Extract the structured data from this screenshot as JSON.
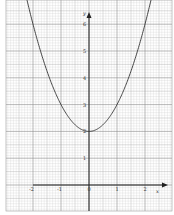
{
  "chart_data": {
    "type": "line",
    "title": "",
    "xlabel": "x",
    "ylabel": "y",
    "xlim": [
      -2.3,
      2.3
    ],
    "ylim": [
      0,
      7
    ],
    "grid": true,
    "grid_style": "graph paper (major 1 unit, minor 0.1 unit)",
    "legend": null,
    "x_ticks": [
      "-2",
      "-1",
      "0",
      "1",
      "2"
    ],
    "y_ticks": [
      "1",
      "2",
      "3",
      "4",
      "5",
      "6"
    ],
    "series": [
      {
        "name": "y = x^2 + 2",
        "x": [
          -2.3,
          -2,
          -1.5,
          -1,
          -0.5,
          0,
          0.5,
          1,
          1.5,
          2,
          2.3
        ],
        "values": [
          7.29,
          6,
          4.25,
          3,
          2.25,
          2,
          2.25,
          3,
          4.25,
          6,
          7.29
        ]
      }
    ]
  },
  "colors": {
    "paper": "#ffffff",
    "grid_minor": "#c8c8c8",
    "grid_major": "#8a8a8a",
    "axis": "#222222",
    "curve": "#333333"
  },
  "labels": {
    "x_axis_name": "x",
    "y_axis_name": "y",
    "x_tick_labels": [
      "-2",
      "-1",
      "0",
      "1",
      "2"
    ],
    "y_tick_labels": [
      "1",
      "2",
      "3",
      "4",
      "5",
      "6"
    ]
  }
}
